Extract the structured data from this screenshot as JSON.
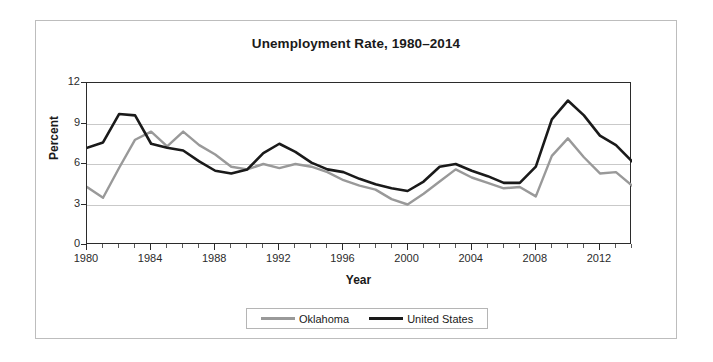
{
  "chart_data": {
    "type": "line",
    "title": "Unemployment Rate, 1980–2014",
    "xlabel": "Year",
    "ylabel": "Percent",
    "xlim": [
      1980,
      2014
    ],
    "ylim": [
      0,
      12
    ],
    "yticks": [
      0,
      3,
      6,
      9,
      12
    ],
    "xticks": [
      1980,
      1984,
      1988,
      1992,
      1996,
      2000,
      2004,
      2008,
      2012
    ],
    "xtick_minor_step": 1,
    "grid": "horizontal",
    "legend_position": "bottom-center",
    "x": [
      1980,
      1981,
      1982,
      1983,
      1984,
      1985,
      1986,
      1987,
      1988,
      1989,
      1990,
      1991,
      1992,
      1993,
      1994,
      1995,
      1996,
      1997,
      1998,
      1999,
      2000,
      2001,
      2002,
      2003,
      2004,
      2005,
      2006,
      2007,
      2008,
      2009,
      2010,
      2011,
      2012,
      2013,
      2014
    ],
    "series": [
      {
        "name": "Oklahoma",
        "color": "#999999",
        "values": [
          4.3,
          3.5,
          5.7,
          7.8,
          8.4,
          7.3,
          8.4,
          7.4,
          6.7,
          5.8,
          5.6,
          6.0,
          5.7,
          6.0,
          5.8,
          5.4,
          4.8,
          4.4,
          4.1,
          3.4,
          3.0,
          3.8,
          4.7,
          5.6,
          5.0,
          4.6,
          4.2,
          4.3,
          3.6,
          6.6,
          7.9,
          6.5,
          5.3,
          5.4,
          4.4
        ]
      },
      {
        "name": "United States",
        "color": "#1a1a1a",
        "values": [
          7.2,
          7.6,
          9.7,
          9.6,
          7.5,
          7.2,
          7.0,
          6.2,
          5.5,
          5.3,
          5.6,
          6.8,
          7.5,
          6.9,
          6.1,
          5.6,
          5.4,
          4.9,
          4.5,
          4.2,
          4.0,
          4.7,
          5.8,
          6.0,
          5.5,
          5.1,
          4.6,
          4.6,
          5.8,
          9.3,
          10.7,
          9.6,
          8.1,
          7.4,
          6.2
        ]
      }
    ]
  },
  "legend": {
    "items": [
      {
        "label": "Oklahoma"
      },
      {
        "label": "United States"
      }
    ]
  }
}
